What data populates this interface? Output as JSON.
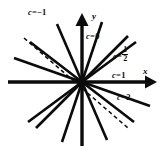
{
  "figure": {
    "type": "line-family-diagram",
    "background_color": "#ffffff",
    "ink_color": "#0b0b0b",
    "axes": {
      "x_label": "x",
      "y_label": "y",
      "origin": {
        "x": 82,
        "y": 82
      },
      "x_axis": {
        "from_x": 8,
        "to_x": 155,
        "y": 82,
        "arrow": "right"
      },
      "y_axis": {
        "x": 82,
        "from_y": 142,
        "to_y": 14,
        "arrow": "up"
      }
    },
    "curve_labels": [
      {
        "id": "c-neg1",
        "c_symbol": "c",
        "equals": "=",
        "value": "−1",
        "text": "c = −1"
      },
      {
        "id": "c-0",
        "c_symbol": "c",
        "equals": "=",
        "value": "0",
        "text": "c = 0"
      },
      {
        "id": "c-half",
        "c_symbol": "c",
        "equals": "=",
        "numerator": "1",
        "denominator": "2",
        "text": "c = 1/2"
      },
      {
        "id": "c-1",
        "c_symbol": "c",
        "equals": "=",
        "value": "1",
        "text": "c = 1"
      },
      {
        "id": "c-2",
        "c_symbol": "c",
        "equals": "=",
        "value": "2",
        "text": "c = 2"
      }
    ],
    "lines": [
      {
        "id": "line-1",
        "style": "solid",
        "angle_deg": 72,
        "length": 70
      },
      {
        "id": "line-2",
        "style": "solid",
        "angle_deg": 50,
        "length": 66
      },
      {
        "id": "line-3",
        "style": "solid",
        "angle_deg": 22,
        "length": 72
      },
      {
        "id": "line-4",
        "style": "solid",
        "angle_deg": 107,
        "length": 64
      },
      {
        "id": "line-5",
        "style": "solid",
        "angle_deg": 132,
        "length": 72
      },
      {
        "id": "line-6",
        "style": "solid",
        "angle_deg": 160,
        "length": 76
      },
      {
        "id": "line-7",
        "style": "dashed",
        "angle_deg": 146,
        "length": 70
      },
      {
        "id": "line-8",
        "style": "solid",
        "angle_deg": 252,
        "length": 60
      },
      {
        "id": "line-9",
        "style": "solid",
        "angle_deg": 287,
        "length": 66
      }
    ]
  }
}
